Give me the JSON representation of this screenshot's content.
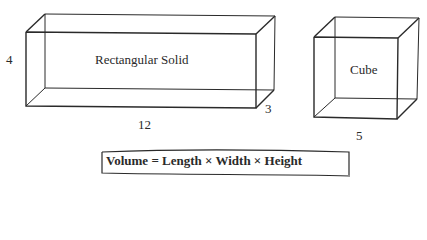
{
  "figure": {
    "rectangular_solid": {
      "name": "Rectangular Solid",
      "height_label": "4",
      "length_label": "12",
      "width_label": "3"
    },
    "cube": {
      "name": "Cube",
      "side_label": "5"
    },
    "formula": "Volume = Length × Width × Height"
  },
  "colors": {
    "line": "#2a2a2a",
    "background": "#ffffff"
  }
}
